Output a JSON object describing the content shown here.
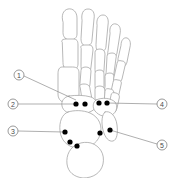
{
  "figure": {
    "background_color": "#ffffff",
    "bone_outline_color": "#9a9a9a",
    "marker_color": "#000000",
    "leader_color": "#8c8c8c",
    "callout_text_color": "#4a4a4a",
    "width": 175,
    "height": 178
  },
  "callouts": [
    {
      "id": "callout-1",
      "label": "1",
      "circle": {
        "cx": 19,
        "cy": 75,
        "r": 5
      },
      "leader": {
        "x1": 24,
        "y1": 76,
        "x2": 76,
        "y2": 100
      }
    },
    {
      "id": "callout-2",
      "label": "2",
      "circle": {
        "cx": 13,
        "cy": 104,
        "r": 5
      },
      "leader": {
        "x1": 18,
        "y1": 104,
        "x2": 75,
        "y2": 104
      }
    },
    {
      "id": "callout-3",
      "label": "3",
      "circle": {
        "cx": 13,
        "cy": 131,
        "r": 5
      },
      "leader": {
        "x1": 18,
        "y1": 131,
        "x2": 64,
        "y2": 132
      }
    },
    {
      "id": "callout-4",
      "label": "4",
      "circle": {
        "cx": 162,
        "cy": 104,
        "r": 5
      },
      "leader": {
        "x1": 157,
        "y1": 104,
        "x2": 107,
        "y2": 103
      }
    },
    {
      "id": "callout-5",
      "label": "5",
      "circle": {
        "cx": 162,
        "cy": 145,
        "r": 5
      },
      "leader": {
        "x1": 157,
        "y1": 144,
        "x2": 110,
        "y2": 130
      }
    }
  ],
  "markers": [
    {
      "id": "marker-a",
      "cx": 76,
      "cy": 104,
      "r": 2.6
    },
    {
      "id": "marker-b",
      "cx": 85,
      "cy": 104,
      "r": 2.6
    },
    {
      "id": "marker-c",
      "cx": 99,
      "cy": 103,
      "r": 2.6
    },
    {
      "id": "marker-d",
      "cx": 107,
      "cy": 103,
      "r": 2.6
    },
    {
      "id": "marker-e",
      "cx": 65,
      "cy": 132,
      "r": 2.6
    },
    {
      "id": "marker-f",
      "cx": 70,
      "cy": 142,
      "r": 2.6
    },
    {
      "id": "marker-g",
      "cx": 77,
      "cy": 146,
      "r": 2.6
    },
    {
      "id": "marker-h",
      "cx": 100,
      "cy": 133,
      "r": 2.6
    },
    {
      "id": "marker-i",
      "cx": 110,
      "cy": 130,
      "r": 2.6
    }
  ],
  "bones": [
    {
      "id": "hallux-distal-phalanx",
      "d": "M63,22 C61,16 63,10 68,9 C73,8 77,12 77,18 L77,34 C77,38 74,40 70,40 C66,40 63,37 63,33 Z"
    },
    {
      "id": "second-distal-phalanx",
      "d": "M82,20 C81,14 83,9 88,9 C93,9 95,13 94,19 L92,40 C92,44 89,46 86,46 C83,46 81,43 81,39 Z"
    },
    {
      "id": "third-distal-phalanx",
      "d": "M97,25 C96,19 99,15 103,15 C107,15 109,19 108,25 L106,46 C106,50 103,52 100,52 C97,52 96,49 96,45 Z"
    },
    {
      "id": "fourth-distal-phalanx",
      "d": "M110,33 C109,27 112,23 116,24 C120,25 121,29 120,34 L117,53 C116,57 114,59 111,58 C108,58 107,55 108,51 Z"
    },
    {
      "id": "fifth-distal-phalanx",
      "d": "M121,45 C121,40 124,37 127,38 C130,39 131,43 130,47 L127,62 C126,66 124,67 121,66 C118,66 118,63 118,59 Z"
    },
    {
      "id": "hallux-proximal-phalanx",
      "d": "M62,42 C61,41 62,39 66,39 L73,39 C77,39 78,41 78,45 L78,64 C78,68 75,70 71,70 C66,70 63,68 63,63 Z"
    },
    {
      "id": "second-proximal-phalanx",
      "d": "M81,48 C80,46 82,45 85,45 L89,45 C92,45 93,47 93,50 L91,67 C91,70 89,72 86,72 C83,72 81,70 81,67 Z"
    },
    {
      "id": "second-middle-phalanx",
      "d": "M81,70 C81,68 83,67 86,67 C89,67 91,69 91,71 L90,84 C90,87 88,89 85,89 C82,89 80,87 80,84 Z"
    },
    {
      "id": "third-proximal-phalanx",
      "d": "M95,52 C95,50 97,49 100,49 C103,49 105,51 105,54 L104,70 C104,73 102,75 99,75 C96,75 95,73 95,70 Z"
    },
    {
      "id": "third-middle-phalanx",
      "d": "M95,73 C95,71 97,70 100,70 C103,70 104,72 104,74 L104,86 C104,89 102,91 99,91 C96,91 95,89 95,86 Z"
    },
    {
      "id": "fourth-proximal-phalanx",
      "d": "M107,56 C107,54 109,53 112,53 C115,53 117,55 116,58 L114,73 C114,76 112,78 109,78 C106,78 105,76 106,73 Z"
    },
    {
      "id": "fourth-middle-phalanx",
      "d": "M105,76 C105,74 107,73 110,73 C113,73 114,75 114,77 L113,88 C113,91 111,93 108,92 C105,92 104,90 105,87 Z"
    },
    {
      "id": "fifth-proximal-phalanx",
      "d": "M117,63 C117,61 119,60 122,61 C125,61 126,64 125,66 L122,79 C121,82 119,83 117,83 C114,82 113,80 114,77 Z"
    },
    {
      "id": "fifth-middle-phalanx",
      "d": "M113,82 C113,80 115,79 118,80 C121,80 122,82 121,85 L119,94 C118,97 116,98 114,97 C111,97 111,95 111,92 Z"
    },
    {
      "id": "first-metatarsal",
      "d": "M62,67 C59,67 58,70 58,74 L58,94 C58,100 62,103 68,103 C75,103 79,100 79,94 L79,73 C79,69 77,67 73,67 Z"
    },
    {
      "id": "second-metatarsal",
      "d": "M80,87 C79,85 81,84 84,84 C88,84 90,86 90,89 L92,99 C93,103 91,105 88,105 C85,105 83,103 82,99 Z"
    },
    {
      "id": "third-metatarsal",
      "d": "M95,89 C95,87 97,86 100,86 C103,86 105,88 105,91 L105,101 C105,105 103,107 100,107 C96,107 95,105 95,101 Z"
    },
    {
      "id": "fourth-metatarsal",
      "d": "M105,91 C105,89 107,88 110,89 C113,89 114,91 114,94 L113,104 C112,108 110,110 107,109 C104,108 103,106 104,102 Z"
    },
    {
      "id": "fifth-metatarsal",
      "d": "M111,95 C111,93 113,92 116,93 C119,94 120,96 119,99 L117,108 C116,112 114,113 111,112 C108,111 108,109 109,105 Z"
    },
    {
      "id": "navicular-cuneiforms",
      "d": "M69,96 C64,97 61,101 62,106 C63,111 68,114 76,114 C86,114 93,112 96,107 C98,103 96,99 91,97 C84,95 76,95 69,96 Z"
    },
    {
      "id": "cuboid",
      "d": "M96,100 C93,102 92,107 95,111 C99,116 106,118 112,115 C117,112 118,106 115,102 C111,98 102,97 96,100 Z"
    },
    {
      "id": "talus",
      "d": "M68,112 C62,114 59,122 60,131 C61,140 67,147 77,148 C88,149 97,144 100,135 C103,126 99,117 90,113 C83,110 74,110 68,112 Z"
    },
    {
      "id": "calcaneus",
      "d": "M78,144 C70,147 66,155 67,164 C68,172 74,177 83,178 C93,178 101,173 103,164 C105,154 100,146 91,143 C87,142 82,142 78,144 Z"
    },
    {
      "id": "lateral-malleolus-column",
      "d": "M105,112 C102,114 101,122 103,130 C105,138 109,142 113,141 C117,140 118,133 117,125 C116,116 110,110 105,112 Z"
    }
  ]
}
